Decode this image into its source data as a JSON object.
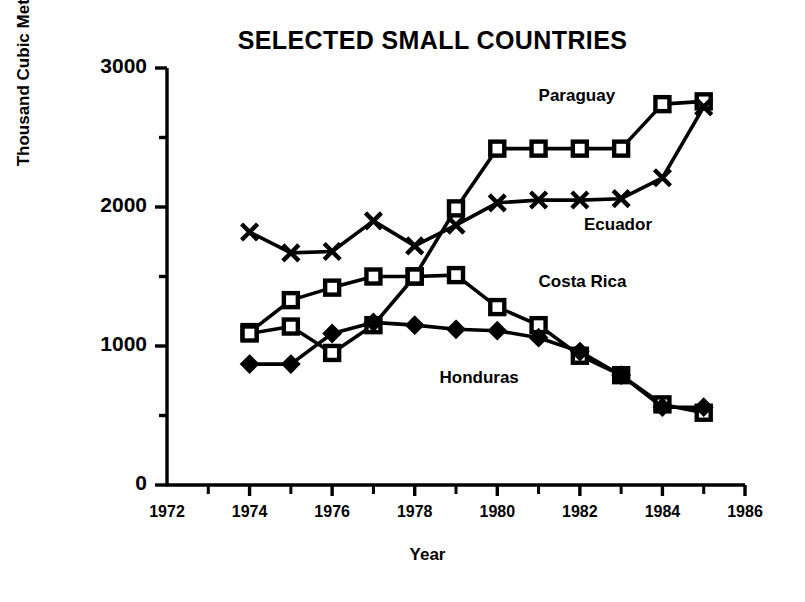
{
  "chart_data": {
    "type": "line",
    "title": "SELECTED SMALL COUNTRIES",
    "xlabel": "Year",
    "ylabel": "Thousand Cubic Meters",
    "xlim": [
      1972,
      1986
    ],
    "ylim": [
      0,
      3000
    ],
    "ytick_labels": [
      "0",
      "1000",
      "2000",
      "3000"
    ],
    "ytick_values": [
      0,
      1000,
      2000,
      3000
    ],
    "yminor_values": [
      500,
      1500,
      2500
    ],
    "xtick_labels": [
      "1972",
      "1974",
      "1976",
      "1978",
      "1980",
      "1982",
      "1984",
      "1986"
    ],
    "xtick_values": [
      1972,
      1974,
      1976,
      1978,
      1980,
      1982,
      1984,
      1986
    ],
    "xminor_values": [
      1973,
      1975,
      1977,
      1979,
      1981,
      1983,
      1985
    ],
    "grid": false,
    "legend": "inline-annotations",
    "x": [
      1974,
      1975,
      1976,
      1977,
      1978,
      1979,
      1980,
      1981,
      1982,
      1983,
      1984,
      1985
    ],
    "series": [
      {
        "name": "Paraguay",
        "marker": "open-square",
        "label_x": 1981.0,
        "label_y": 2790,
        "values": [
          1100,
          1330,
          1420,
          1500,
          1500,
          1990,
          2420,
          2420,
          2420,
          2420,
          2740,
          2760
        ]
      },
      {
        "name": "Ecuador",
        "marker": "x-cross",
        "label_x": 1982.1,
        "label_y": 1860,
        "values": [
          1820,
          1670,
          1680,
          1900,
          1720,
          1870,
          2030,
          2050,
          2050,
          2060,
          2210,
          2720
        ]
      },
      {
        "name": "Costa Rica",
        "marker": "open-square",
        "label_x": 1981.0,
        "label_y": 1450,
        "values": [
          1090,
          1140,
          950,
          1150,
          1500,
          1510,
          1280,
          1150,
          930,
          790,
          580,
          520
        ]
      },
      {
        "name": "Honduras",
        "marker": "filled-diamond",
        "label_x": 1978.6,
        "label_y": 760,
        "values": [
          870,
          870,
          1090,
          1170,
          1150,
          1120,
          1110,
          1060,
          960,
          790,
          560,
          560
        ]
      }
    ]
  }
}
